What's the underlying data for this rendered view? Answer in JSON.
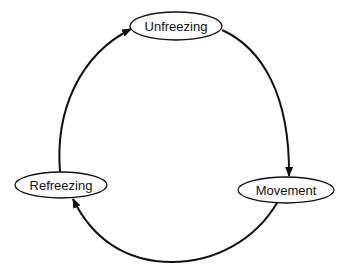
{
  "diagram": {
    "type": "cycle",
    "stroke_color": "#111111",
    "background": "#ffffff",
    "nodes": [
      {
        "id": "unfreezing",
        "label": "Unfreezing"
      },
      {
        "id": "movement",
        "label": "Movement"
      },
      {
        "id": "refreezing",
        "label": "Refreezing"
      }
    ],
    "edges": [
      {
        "from": "unfreezing",
        "to": "movement",
        "direction": "clockwise"
      },
      {
        "from": "movement",
        "to": "refreezing",
        "direction": "clockwise"
      },
      {
        "from": "refreezing",
        "to": "unfreezing",
        "direction": "clockwise"
      }
    ]
  }
}
